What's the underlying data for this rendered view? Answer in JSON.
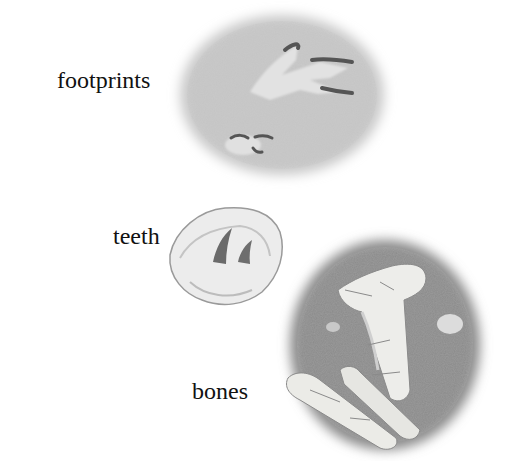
{
  "illustration": {
    "subject": "fossil types",
    "panels": [
      {
        "id": "footprints",
        "label": "footprints",
        "icon": "footprint-fossil-icon"
      },
      {
        "id": "teeth",
        "label": "teeth",
        "icon": "teeth-fossil-icon"
      },
      {
        "id": "bones",
        "label": "bones",
        "icon": "bone-fossil-icon"
      }
    ]
  },
  "colors": {
    "background": "#ffffff",
    "text": "#111111",
    "stone_light": "#e4e4e4",
    "stone_mid": "#bdbdbd",
    "stone_dark": "#7a7a7a",
    "bone": "#eeeeea",
    "tooth": "#6e6e6e"
  }
}
